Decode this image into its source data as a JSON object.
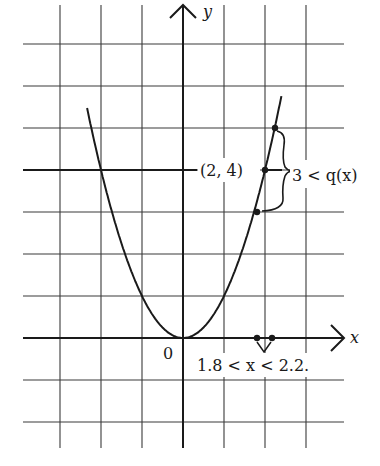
{
  "diagram": {
    "type": "function-graph",
    "function": "y = x^2",
    "axes": {
      "x_label": "x",
      "y_label": "y",
      "origin_label": "0"
    },
    "grid": {
      "x_lines": [
        -3,
        -2,
        -1,
        0,
        1,
        2,
        3
      ],
      "y_lines": [
        7,
        6,
        5,
        4,
        3,
        2,
        1,
        0,
        -1,
        -2
      ]
    },
    "points": [
      {
        "name": "point-2-4",
        "x": 2,
        "y": 4,
        "label": "(2, 4)"
      },
      {
        "name": "point-upper-bound",
        "x": 2.236,
        "y": 5
      },
      {
        "name": "point-lower-bound",
        "x": 1.732,
        "y": 3
      },
      {
        "name": "x-interval-left",
        "x": 1.8,
        "y": 0
      },
      {
        "name": "x-interval-right",
        "x": 2.2,
        "y": 0
      }
    ],
    "annotations": {
      "y_interval": "3 < q(x)",
      "x_interval": "1.8 < x < 2.2."
    },
    "colors": {
      "ink": "#1a1a1a",
      "grid": "#3a3a3a",
      "background": "#ffffff"
    }
  }
}
